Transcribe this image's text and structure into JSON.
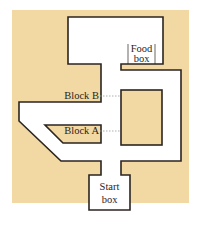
{
  "diagram": {
    "type": "maze",
    "colors": {
      "background": "#f2d9a4",
      "path": "#ffffff",
      "wall": "#2b2520",
      "leader": "#9a9a9a"
    },
    "labels": {
      "food_box_line1": "Food",
      "food_box_line2": "box",
      "start_box_line1": "Start",
      "start_box_line2": "box",
      "block_b": "Block B",
      "block_a": "Block A"
    }
  }
}
